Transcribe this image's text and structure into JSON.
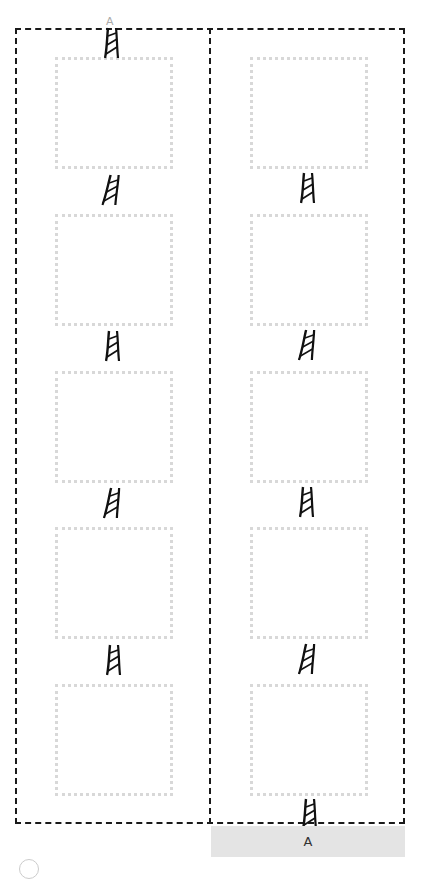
{
  "diagram": {
    "columns": [
      {
        "id": "left",
        "frames": [
          {
            "label": ""
          },
          {
            "label": ""
          },
          {
            "label": ""
          },
          {
            "label": ""
          },
          {
            "label": ""
          }
        ]
      },
      {
        "id": "right",
        "frames": [
          {
            "label": ""
          },
          {
            "label": ""
          },
          {
            "label": ""
          },
          {
            "label": ""
          },
          {
            "label": ""
          }
        ]
      }
    ],
    "top_marker": "A",
    "bottom_bar": {
      "label": "A"
    },
    "colors": {
      "outline": "#1a1a1a",
      "frame_border": "#d8d8d8",
      "bar_bg": "#e4e4e4"
    }
  }
}
